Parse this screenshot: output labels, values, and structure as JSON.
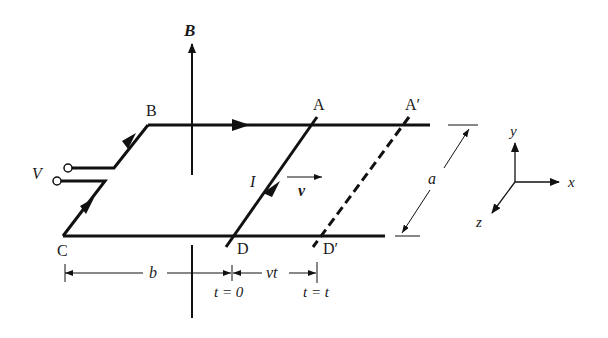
{
  "diagram": {
    "colors": {
      "ink": "#111111",
      "background": "#ffffff"
    },
    "labels": {
      "field": "B",
      "corner_b": "B",
      "corner_c": "C",
      "point_a": "A",
      "point_a_prime": "A′",
      "point_d": "D",
      "point_d_prime": "D′",
      "voltage": "V",
      "current": "I",
      "velocity": "v",
      "width": "a",
      "distance_b": "b",
      "displacement": "vt",
      "time_zero": "t = 0",
      "time_t": "t = t"
    },
    "axes": {
      "y": "y",
      "x": "x",
      "z": "z"
    }
  }
}
